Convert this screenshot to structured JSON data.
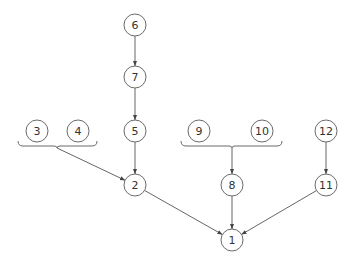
{
  "diagram": {
    "type": "tree",
    "nodes": [
      {
        "id": "1",
        "label": "1",
        "x": 232,
        "y": 240
      },
      {
        "id": "2",
        "label": "2",
        "x": 135,
        "y": 185
      },
      {
        "id": "3",
        "label": "3",
        "x": 37,
        "y": 131
      },
      {
        "id": "4",
        "label": "4",
        "x": 78,
        "y": 131
      },
      {
        "id": "5",
        "label": "5",
        "x": 135,
        "y": 131
      },
      {
        "id": "6",
        "label": "6",
        "x": 135,
        "y": 25
      },
      {
        "id": "7",
        "label": "7",
        "x": 135,
        "y": 77
      },
      {
        "id": "8",
        "label": "8",
        "x": 232,
        "y": 185
      },
      {
        "id": "9",
        "label": "9",
        "x": 199,
        "y": 131
      },
      {
        "id": "10",
        "label": "10",
        "x": 262,
        "y": 131
      },
      {
        "id": "11",
        "label": "11",
        "x": 326,
        "y": 185
      },
      {
        "id": "12",
        "label": "12",
        "x": 326,
        "y": 131
      }
    ],
    "edges": [
      {
        "from": "6",
        "to": "7"
      },
      {
        "from": "7",
        "to": "5"
      },
      {
        "from": "5",
        "to": "2"
      },
      {
        "from": "group-3-4",
        "to": "2"
      },
      {
        "from": "group-9-10",
        "to": "8"
      },
      {
        "from": "12",
        "to": "11"
      },
      {
        "from": "2",
        "to": "1"
      },
      {
        "from": "8",
        "to": "1"
      },
      {
        "from": "11",
        "to": "1"
      }
    ],
    "groups": [
      {
        "id": "group-3-4",
        "members": [
          "3",
          "4"
        ],
        "x1": 18,
        "x2": 97,
        "y": 146,
        "apex_x": 57
      },
      {
        "id": "group-9-10",
        "members": [
          "9",
          "10"
        ],
        "x1": 181,
        "x2": 282,
        "y": 146,
        "apex_x": 232
      }
    ],
    "node_radius": 11,
    "colors": {
      "stroke": "#6b6b6b",
      "edge": "#555555",
      "text": "#333333",
      "background": "#ffffff"
    }
  }
}
